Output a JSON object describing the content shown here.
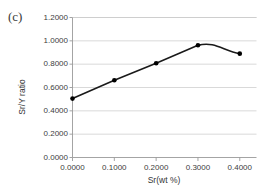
{
  "panel": {
    "label": "(c)"
  },
  "chart_data": {
    "type": "line",
    "title": "",
    "xlabel": "Sr(wt %)",
    "ylabel": "Sr/Y ratio",
    "x": [
      0.0,
      0.1,
      0.2,
      0.3,
      0.4
    ],
    "values": [
      0.505,
      0.662,
      0.808,
      0.962,
      0.89
    ],
    "series": [
      {
        "name": "Sr/Y ratio",
        "values": [
          0.505,
          0.662,
          0.808,
          0.962,
          0.89
        ]
      }
    ],
    "xlim": [
      0.0,
      0.44
    ],
    "ylim": [
      0.0,
      1.2
    ],
    "xticks": [
      0.0,
      0.1,
      0.2,
      0.3,
      0.4
    ],
    "yticks": [
      0.0,
      0.2,
      0.4,
      0.6,
      0.8,
      1.0,
      1.2
    ],
    "xtick_labels": [
      "0.0000",
      "0.1000",
      "0.2000",
      "0.3000",
      "0.4000"
    ],
    "ytick_labels": [
      "0.0000",
      "0.2000",
      "0.4000",
      "0.6000",
      "0.8000",
      "1.0000",
      "1.2000"
    ],
    "grid": "horizontal",
    "legend": "none",
    "marker": "filled-circle",
    "line_color": "#1a1a1a",
    "marker_color": "#000000",
    "grid_color": "#c8c8c8",
    "axis_color": "#9a9a9a",
    "background": "#ffffff"
  }
}
